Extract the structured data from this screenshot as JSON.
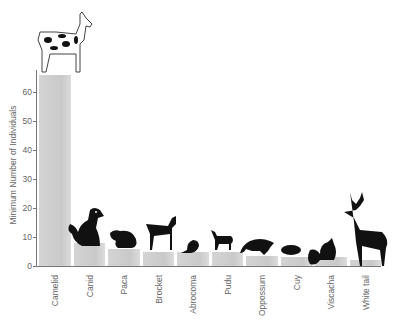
{
  "chart_data": {
    "type": "bar",
    "title": "",
    "xlabel": "",
    "ylabel": "Minimum Number of Individuals",
    "categories": [
      "Camelid",
      "Canid",
      "Paca",
      "Brocket",
      "Abrocoma",
      "Pudu",
      "Oppossum",
      "Cuy",
      "Viscacha",
      "White tail"
    ],
    "values": [
      66,
      8,
      6,
      5,
      5,
      5,
      3.5,
      3,
      3,
      2
    ],
    "ylim": [
      0,
      70
    ],
    "yticks": [
      0,
      10,
      20,
      30,
      40,
      50,
      60
    ],
    "grid": false,
    "legend": null,
    "annotations": [
      "animal silhouette above each bar"
    ],
    "bar_color": "#cccccc"
  },
  "labels": {
    "ylabel": "Minimum Number of Individuals"
  }
}
